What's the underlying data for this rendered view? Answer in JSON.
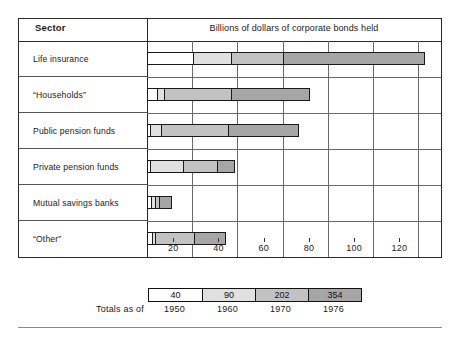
{
  "header": {
    "sector_label": "Sector",
    "value_title": "Billions of dollars of corporate bonds held"
  },
  "legend": {
    "totals_label": "Totals as of",
    "entries": [
      {
        "year": "1950",
        "total": "40",
        "color": "#ffffff"
      },
      {
        "year": "1960",
        "total": "90",
        "color": "#e0e0e0"
      },
      {
        "year": "1970",
        "total": "202",
        "color": "#c2c2c2"
      },
      {
        "year": "1976",
        "total": "354",
        "color": "#a6a6a6"
      }
    ]
  },
  "axis": {
    "ticks": [
      "20",
      "40",
      "60",
      "80",
      "100",
      "120"
    ],
    "min": 0,
    "max": 130
  },
  "chart_data": {
    "type": "bar",
    "orientation": "horizontal",
    "stacked": "cumulative-by-year",
    "title": "Billions of dollars of corporate bonds held",
    "xlabel": "Billions of dollars of corporate bonds held",
    "ylabel": "Sector",
    "xlim": [
      0,
      130
    ],
    "xticks": [
      20,
      40,
      60,
      80,
      100,
      120
    ],
    "grid": true,
    "legend_position": "bottom",
    "categories": [
      "Life insurance",
      "“Households”",
      "Public pension funds",
      "Private pension funds",
      "Mutual savings banks",
      "“Other”"
    ],
    "series": [
      {
        "name": "1950",
        "color": "#ffffff",
        "values": [
          20,
          4,
          1,
          1,
          1.5,
          2
        ]
      },
      {
        "name": "1960",
        "color": "#e0e0e0",
        "values": [
          37,
          7,
          6,
          16,
          3.5,
          3
        ]
      },
      {
        "name": "1970",
        "color": "#c2c2c2",
        "values": [
          60,
          37,
          36,
          31,
          5.5,
          21
        ]
      },
      {
        "name": "1976",
        "color": "#a6a6a6",
        "values": [
          123,
          72,
          67,
          39,
          11,
          35
        ]
      }
    ],
    "series_totals": {
      "1950": 40,
      "1960": 90,
      "1970": 202,
      "1976": 354
    },
    "note": "series values are cumulative bar end positions in billions of dollars"
  }
}
